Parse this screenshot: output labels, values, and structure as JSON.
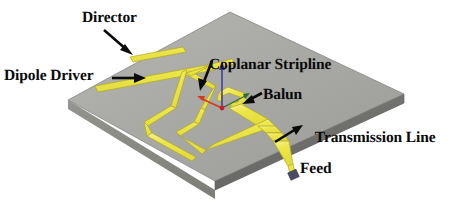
{
  "figure": {
    "type": "3d-perspective-diagram",
    "background_color": "#ffffff"
  },
  "substrate": {
    "name": "dielectric-substrate",
    "top_face_color": "#a6a6a3",
    "top_face_color_light": "#b4b4b1",
    "side_face_color": "#6e6e6b",
    "front_face_color": "#8a8a87",
    "edge_color": "#5a5a58"
  },
  "metal": {
    "trace_color": "#ece64a",
    "trace_color_light": "#f4f08a",
    "trace_outline": "#b3ab1c",
    "port_color": "#4a4a63"
  },
  "axes": {
    "z_color": "#3a3a9e",
    "x_color": "#d63a1e",
    "y_color": "#2f7a2f",
    "origin_color": "#c02020",
    "z_label": "z",
    "x_label": "x",
    "y_label": "y"
  },
  "labels": [
    {
      "id": "director",
      "text": "Director",
      "arrow": "down-right",
      "points_to": "director-strip"
    },
    {
      "id": "dipole_driver",
      "text": "Dipole Driver",
      "arrow": "right",
      "points_to": "dipole-driver-strip"
    },
    {
      "id": "coplanar_stripline",
      "text": "Coplanar Stripline",
      "arrow": "down-left",
      "points_to": "coplanar-stripline-pair"
    },
    {
      "id": "balun",
      "text": "Balun",
      "arrow": "left",
      "points_to": "balun-loop"
    },
    {
      "id": "transmission_line_feed",
      "text_line_1": "Transmission Line",
      "text_line_2": "Feed",
      "arrow": "up-right",
      "points_to": "feed-line"
    }
  ],
  "structures": [
    {
      "id": "director-strip",
      "name": "Director"
    },
    {
      "id": "dipole-driver-strip",
      "name": "Dipole Driver"
    },
    {
      "id": "coplanar-stripline-pair",
      "name": "Coplanar Stripline"
    },
    {
      "id": "balun-loop",
      "name": "Balun"
    },
    {
      "id": "feed-line",
      "name": "Transmission Line Feed"
    },
    {
      "id": "feed-port",
      "name": "Excitation Port"
    }
  ]
}
